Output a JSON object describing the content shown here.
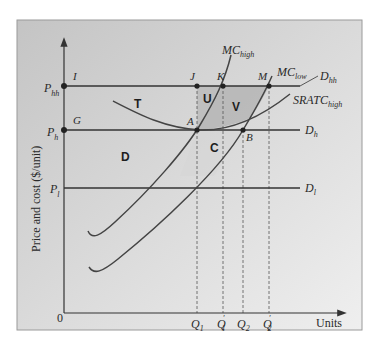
{
  "diagram": {
    "type": "economics-cost-curves",
    "y_axis_label": "Price and cost ($/unit)",
    "x_axis_label": "Units",
    "origin_label": "0",
    "price_levels": [
      {
        "id": "P_hh",
        "base": "P",
        "sub": "hh",
        "demand_label": "D",
        "demand_sub": "hh"
      },
      {
        "id": "P_h",
        "base": "P",
        "sub": "h",
        "demand_label": "D",
        "demand_sub": "h"
      },
      {
        "id": "P_l",
        "base": "P",
        "sub": "l",
        "demand_label": "D",
        "demand_sub": "l"
      }
    ],
    "quantities": [
      {
        "id": "Q1",
        "base": "Q",
        "sub": "1",
        "prime": ""
      },
      {
        "id": "Q1p",
        "base": "Q",
        "sub": "1",
        "prime": "′"
      },
      {
        "id": "Q2",
        "base": "Q",
        "sub": "2",
        "prime": ""
      },
      {
        "id": "Q2p",
        "base": "Q",
        "sub": "2",
        "prime": "′"
      }
    ],
    "points": {
      "I": "I",
      "J": "J",
      "K": "K",
      "M": "M",
      "G": "G",
      "A": "A",
      "B": "B"
    },
    "curves": {
      "mc_high": {
        "base": "MC",
        "sub": "high"
      },
      "mc_low": {
        "base": "MC",
        "sub": "low"
      },
      "srac_high": {
        "base": "SRATC",
        "sub": "high"
      }
    },
    "regions": {
      "T": "T",
      "U": "U",
      "V": "V",
      "D": "D",
      "C": "C"
    },
    "colors": {
      "background_top": "#c9c9c9",
      "background_bottom": "#ececec",
      "line": "#333333",
      "shade": "#b5b5b5"
    }
  }
}
